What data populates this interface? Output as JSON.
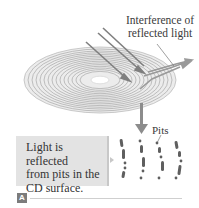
{
  "figure": {
    "annotations": {
      "interference_label": "Interference of reflected light",
      "interference_line1": "Interference of",
      "interference_line2": "reflected light",
      "pits_label": "Pits"
    },
    "callout": {
      "text": "Light is reflected from pits in the CD surface.",
      "line1": "Light is reflected",
      "line2": "from pits in the",
      "line3": "CD surface."
    },
    "panel_tag": "A",
    "colors": {
      "disc_grooves": "#a8a8a8",
      "disc_fill": "#e6e6e6",
      "light_ray": "#8a8a8a",
      "callout_bg": "#e3e3e3",
      "pit_color": "#6e6e6e",
      "tag_bg": "#7c7c7c"
    },
    "elements": [
      "compact-disc",
      "incident-light-rays",
      "reflected-light-rays",
      "magnify-arrow",
      "pit-tracks"
    ]
  }
}
